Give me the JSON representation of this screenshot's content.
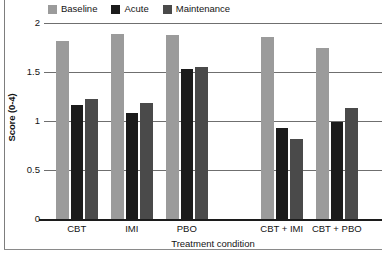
{
  "chart_data": {
    "type": "bar",
    "title": "",
    "subtitle": "",
    "xlabel": "Treatment condition",
    "ylabel": "Score (0-4)",
    "categories": [
      "CBT",
      "IMI",
      "PBO",
      "CBT + IMI",
      "CBT + PBO"
    ],
    "series": [
      {
        "name": "Baseline",
        "color": "#9b9b9b",
        "values": [
          1.82,
          1.89,
          1.88,
          1.86,
          1.74
        ]
      },
      {
        "name": "Acute",
        "color": "#1b1b1b",
        "values": [
          1.16,
          1.08,
          1.53,
          0.93,
          0.99
        ]
      },
      {
        "name": "Maintenance",
        "color": "#4a4a4a",
        "values": [
          1.22,
          1.18,
          1.55,
          0.82,
          1.13
        ]
      }
    ],
    "ylim": [
      0,
      2
    ],
    "yticks": [
      0,
      0.5,
      1,
      1.5,
      2
    ],
    "ytick_labels": [
      "0",
      "0.5",
      "1",
      "1.5",
      "2"
    ],
    "grid": true,
    "grid_axis": "y",
    "legend_position": "top-left",
    "group_gap_after_index": 2,
    "axis_color": "#1c1c1c",
    "grid_color": "#6f6f6f",
    "background": "#ffffff"
  },
  "legend": {
    "items": [
      {
        "label": "Baseline",
        "swatch_name": "legend-swatch-baseline"
      },
      {
        "label": "Acute",
        "swatch_name": "legend-swatch-acute"
      },
      {
        "label": "Maintenance",
        "swatch_name": "legend-swatch-maintenance"
      }
    ]
  },
  "axes": {
    "y_title": "Score (0-4)",
    "x_title": "Treatment condition",
    "y_ticks": [
      "2",
      "1.5",
      "1",
      "0.5",
      "0"
    ],
    "x_ticks": [
      "CBT",
      "IMI",
      "PBO",
      "CBT + IMI",
      "CBT + PBO"
    ]
  }
}
